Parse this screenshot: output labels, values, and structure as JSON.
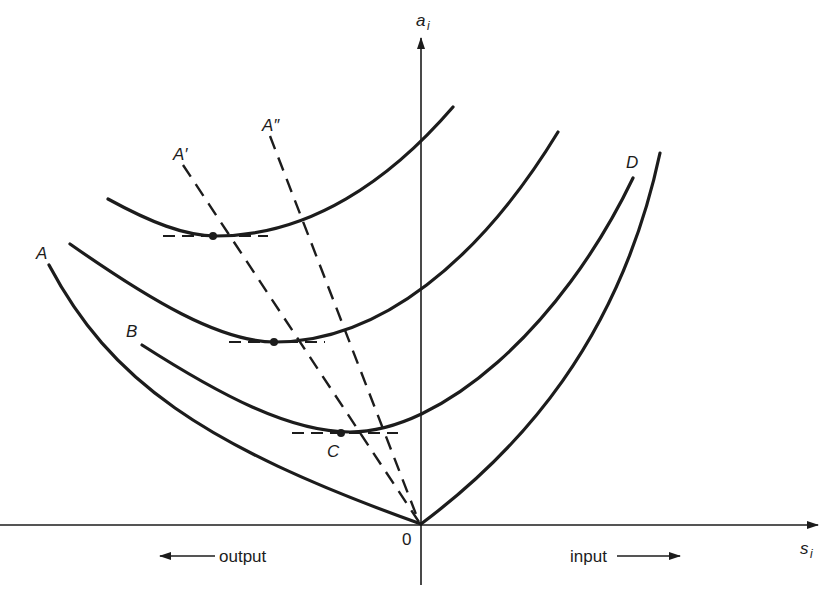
{
  "diagram": {
    "axes": {
      "y_label": "a",
      "y_label_sub": "i",
      "x_label": "s",
      "x_label_sub": "i",
      "origin_label": "0"
    },
    "direction_labels": {
      "left": "output",
      "right": "input"
    },
    "curve_labels": {
      "A": "A",
      "B": "B",
      "C": "C",
      "D": "D",
      "A_prime": "A′",
      "A_double_prime": "A″"
    },
    "colors": {
      "ink": "#1c1c1c",
      "background": "#ffffff"
    }
  }
}
